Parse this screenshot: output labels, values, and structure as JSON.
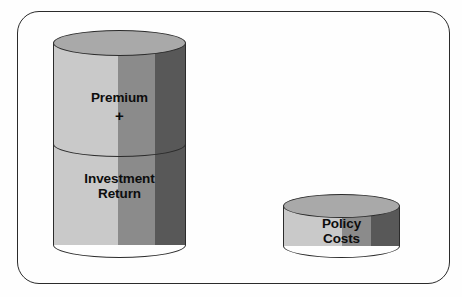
{
  "diagram": {
    "background_color": "#fefefe",
    "frame": {
      "name": "rounded-border-frame",
      "stroke_color": "#2b2b2b",
      "corner_radius_px": 22
    },
    "palette": {
      "band_light": "#c9c9c9",
      "band_mid": "#8b8b8b",
      "band_dark": "#585858",
      "cap_fill": "#a9a9a9",
      "outline": "#2b2b2b",
      "text": "#0d0d0d"
    },
    "shapes": [
      {
        "id": "premium",
        "kind": "cylinder-segment",
        "label": "Premium",
        "position": "upper section of left stacked cylinder"
      },
      {
        "id": "investment_return",
        "kind": "cylinder-segment",
        "label": "Investment\nReturn",
        "position": "lower section of left stacked cylinder"
      },
      {
        "id": "policy_costs",
        "kind": "cylinder",
        "label": "Policy\nCosts",
        "position": "right, short flat cylinder"
      }
    ],
    "operators": [
      {
        "id": "plus",
        "symbol": "+",
        "between": [
          "premium",
          "investment_return"
        ]
      }
    ]
  }
}
